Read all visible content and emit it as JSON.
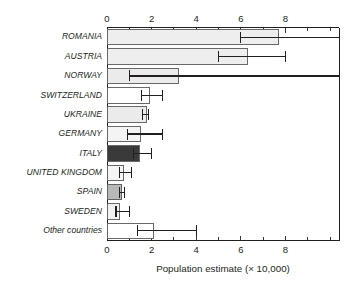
{
  "chart_data": {
    "type": "bar",
    "orientation": "horizontal",
    "title": "",
    "xlabel": "Population estimate (× 10,000)",
    "ylabel": "",
    "xlim": [
      0,
      10.4
    ],
    "grid": false,
    "legend": null,
    "x_major_ticks": [
      0,
      2,
      4,
      6,
      8
    ],
    "x_major_tick_labels": [
      "0",
      "2",
      "4",
      "6",
      "8"
    ],
    "x_minor_ticks": [
      1,
      3,
      5,
      7,
      9,
      10
    ],
    "top_axis": true,
    "bottom_axis": true,
    "categories": [
      "ROMANIA",
      "AUSTRIA",
      "NORWAY",
      "SWITZERLAND",
      "UKRAINE",
      "GERMANY",
      "ITALY",
      "UNITED KINGDOM",
      "SPAIN",
      "SWEDEN",
      "Other countries"
    ],
    "values": [
      7.7,
      6.3,
      3.2,
      1.9,
      1.75,
      1.5,
      1.45,
      0.75,
      0.65,
      0.55,
      2.1
    ],
    "error_low": [
      6.0,
      5.0,
      1.0,
      1.55,
      1.6,
      0.9,
      1.2,
      0.55,
      0.55,
      0.4,
      1.35
    ],
    "error_high": [
      10.4,
      8.0,
      10.4,
      2.5,
      1.85,
      2.5,
      2.0,
      1.1,
      0.8,
      1.0,
      4.0
    ],
    "error_high_clipped": [
      true,
      false,
      true,
      false,
      false,
      false,
      false,
      false,
      false,
      false,
      false
    ],
    "bar_fills": [
      "#eeeeee",
      "#eeeeee",
      "#ebebeb",
      "#ffffff",
      "#ebebeb",
      "#f4f4f4",
      "#3a3a3a",
      "#f5f5f5",
      "#b8b8b8",
      "#f2f2f2",
      "#ffffff"
    ],
    "bar_stroke": "#58595b",
    "axis_color": "#231f20"
  }
}
